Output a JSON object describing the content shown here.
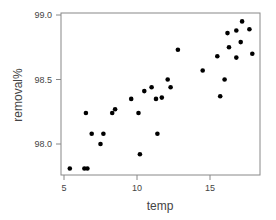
{
  "chart_data": {
    "type": "scatter",
    "title": "",
    "xlabel": "temp",
    "ylabel": "removal%",
    "xlim": [
      4.8,
      18.4
    ],
    "ylim": [
      97.77,
      99.02
    ],
    "xticks": [
      5,
      10,
      15
    ],
    "xtick_labels": [
      "5",
      "10",
      "15"
    ],
    "yticks": [
      98.0,
      98.5,
      99.0
    ],
    "ytick_labels": [
      "98.0",
      "98.5",
      "99.0"
    ],
    "grid": false,
    "legend": null,
    "marker_color": "#000000",
    "points": [
      {
        "x": 5.4,
        "y": 97.81
      },
      {
        "x": 6.4,
        "y": 97.81
      },
      {
        "x": 6.6,
        "y": 97.81
      },
      {
        "x": 6.5,
        "y": 98.24
      },
      {
        "x": 6.9,
        "y": 98.08
      },
      {
        "x": 7.7,
        "y": 98.08
      },
      {
        "x": 7.5,
        "y": 98.0
      },
      {
        "x": 8.3,
        "y": 98.24
      },
      {
        "x": 8.5,
        "y": 98.27
      },
      {
        "x": 9.6,
        "y": 98.35
      },
      {
        "x": 10.1,
        "y": 98.24
      },
      {
        "x": 10.2,
        "y": 97.92
      },
      {
        "x": 10.5,
        "y": 98.41
      },
      {
        "x": 11.0,
        "y": 98.44
      },
      {
        "x": 11.3,
        "y": 98.35
      },
      {
        "x": 11.4,
        "y": 98.08
      },
      {
        "x": 11.7,
        "y": 98.36
      },
      {
        "x": 12.1,
        "y": 98.5
      },
      {
        "x": 12.3,
        "y": 98.44
      },
      {
        "x": 12.8,
        "y": 98.73
      },
      {
        "x": 14.5,
        "y": 98.57
      },
      {
        "x": 15.5,
        "y": 98.68
      },
      {
        "x": 15.7,
        "y": 98.37
      },
      {
        "x": 16.0,
        "y": 98.5
      },
      {
        "x": 16.2,
        "y": 98.86
      },
      {
        "x": 16.3,
        "y": 98.75
      },
      {
        "x": 16.8,
        "y": 98.67
      },
      {
        "x": 16.8,
        "y": 98.88
      },
      {
        "x": 17.1,
        "y": 98.79
      },
      {
        "x": 17.2,
        "y": 98.95
      },
      {
        "x": 17.7,
        "y": 98.89
      },
      {
        "x": 17.9,
        "y": 98.7
      }
    ]
  }
}
